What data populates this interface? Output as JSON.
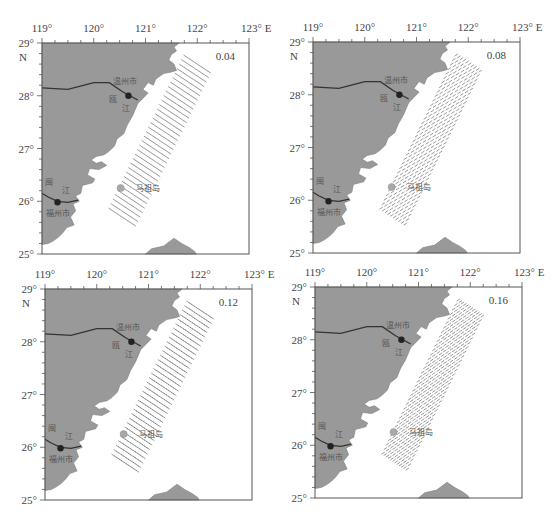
{
  "figure": {
    "axes": {
      "x_ticks": [
        "119°",
        "120°",
        "121°",
        "122°",
        "123° E"
      ],
      "y_ticks": [
        "29°",
        "28°",
        "27°",
        "26°",
        "25°"
      ],
      "y_hemisphere": "N",
      "lon_range": [
        119,
        123
      ],
      "lat_range": [
        25,
        29
      ]
    },
    "labels": {
      "wenzhou_city": "温州市",
      "ou_river_1": "瓯",
      "ou_river_2": "江",
      "min_river_1": "闽",
      "min_river_2": "江",
      "fuzhou_city": "福州市",
      "matsu_island": "马祖岛"
    },
    "panels": [
      {
        "id": "a",
        "value": "0.04"
      },
      {
        "id": "b",
        "value": "0.08"
      },
      {
        "id": "c",
        "value": "0.12"
      },
      {
        "id": "d",
        "value": "0.16"
      }
    ],
    "colors": {
      "land": "#999999",
      "coastline": "#808080",
      "river": "#333333",
      "city_dot": "#222222",
      "island_dot": "#a8a8a8",
      "hatch": "#555555",
      "frame": "#555555"
    }
  }
}
